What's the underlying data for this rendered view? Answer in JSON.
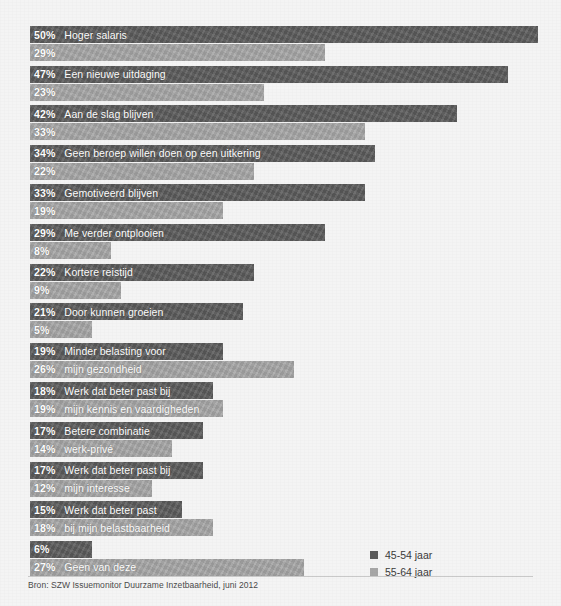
{
  "figure": {
    "background_color": "#f4f4f4",
    "source_note": "Bron: SZW Issuemonitor Duurzame Inzetbaarheid, juni 2012"
  },
  "legend": {
    "position": "bottom-right",
    "items": [
      {
        "label": "45-54 jaar",
        "color": "#5c5c5c",
        "swatch_name": "legend-swatch-45-54"
      },
      {
        "label": "55-64 jaar",
        "color": "#a7a7a7",
        "swatch_name": "legend-swatch-55-64"
      }
    ]
  },
  "chart_data": {
    "type": "bar",
    "orientation": "horizontal",
    "title": "",
    "subtitle": "",
    "xlabel": "",
    "ylabel": "",
    "xlim": [
      0,
      50
    ],
    "grid": false,
    "value_suffix": "%",
    "legend_position": "bottom-right",
    "series": [
      {
        "name": "45-54 jaar",
        "color": "#5c5c5c",
        "values": [
          50,
          47,
          42,
          34,
          33,
          29,
          22,
          21,
          19,
          18,
          17,
          17,
          15,
          6
        ]
      },
      {
        "name": "55-64 jaar",
        "color": "#a7a7a7",
        "values": [
          29,
          23,
          33,
          22,
          19,
          8,
          9,
          5,
          26,
          19,
          14,
          12,
          18,
          27
        ]
      }
    ],
    "categories": [
      "Hoger salaris",
      "Een nieuwe uitdaging",
      "Aan de slag blijven",
      "Geen beroep willen doen op een uitkering",
      "Gemotiveerd blijven",
      "Me verder ontplooien",
      "Kortere reistijd",
      "Door kunnen groeien",
      "Minder belasting voor mijn gezondheid",
      "Werk dat beter past bij mijn kennis en vaardigheden",
      "Betere combinatie werk-privé",
      "Werk dat beter past bij mijn interesse",
      "Werk dat beter past bij mijn belastbaarheid",
      "Geen van deze"
    ],
    "rows": [
      {
        "top_value": "50%",
        "top_value_num": 50,
        "top_label": "Hoger salaris",
        "bottom_value": "29%",
        "bottom_value_num": 29,
        "bottom_label": ""
      },
      {
        "top_value": "47%",
        "top_value_num": 47,
        "top_label": "Een nieuwe uitdaging",
        "bottom_value": "23%",
        "bottom_value_num": 23,
        "bottom_label": ""
      },
      {
        "top_value": "42%",
        "top_value_num": 42,
        "top_label": "Aan de slag blijven",
        "bottom_value": "33%",
        "bottom_value_num": 33,
        "bottom_label": ""
      },
      {
        "top_value": "34%",
        "top_value_num": 34,
        "top_label": "Geen beroep willen doen op een uitkering",
        "bottom_value": "22%",
        "bottom_value_num": 22,
        "bottom_label": ""
      },
      {
        "top_value": "33%",
        "top_value_num": 33,
        "top_label": "Gemotiveerd blijven",
        "bottom_value": "19%",
        "bottom_value_num": 19,
        "bottom_label": ""
      },
      {
        "top_value": "29%",
        "top_value_num": 29,
        "top_label": "Me verder ontplooien",
        "bottom_value": "8%",
        "bottom_value_num": 8,
        "bottom_label": ""
      },
      {
        "top_value": "22%",
        "top_value_num": 22,
        "top_label": "Kortere reistijd",
        "bottom_value": "9%",
        "bottom_value_num": 9,
        "bottom_label": ""
      },
      {
        "top_value": "21%",
        "top_value_num": 21,
        "top_label": "Door kunnen groeien",
        "bottom_value": "5%",
        "bottom_value_num": 5,
        "bottom_label": ""
      },
      {
        "top_value": "19%",
        "top_value_num": 19,
        "top_label": "Minder belasting voor",
        "bottom_value": "26%",
        "bottom_value_num": 26,
        "bottom_label": "mijn gezondheid"
      },
      {
        "top_value": "18%",
        "top_value_num": 18,
        "top_label": "Werk dat beter past bij",
        "bottom_value": "19%",
        "bottom_value_num": 19,
        "bottom_label": "mijn kennis en vaardigheden"
      },
      {
        "top_value": "17%",
        "top_value_num": 17,
        "top_label": "Betere combinatie",
        "bottom_value": "14%",
        "bottom_value_num": 14,
        "bottom_label": "werk-privé"
      },
      {
        "top_value": "17%",
        "top_value_num": 17,
        "top_label": "Werk dat beter past bij",
        "bottom_value": "12%",
        "bottom_value_num": 12,
        "bottom_label": "mijn interesse"
      },
      {
        "top_value": "15%",
        "top_value_num": 15,
        "top_label": "Werk dat beter past",
        "bottom_value": "18%",
        "bottom_value_num": 18,
        "bottom_label": "bij mijn belastbaarheid"
      },
      {
        "top_value": "6%",
        "top_value_num": 6,
        "top_label": "",
        "bottom_value": "27%",
        "bottom_value_num": 27,
        "bottom_label": "Geen van deze"
      }
    ]
  },
  "layout": {
    "bar_origin_x": 30,
    "px_per_percent": 10.16,
    "first_group_top": 26,
    "group_pitch": 39.6,
    "min_bar_width": 62
  }
}
